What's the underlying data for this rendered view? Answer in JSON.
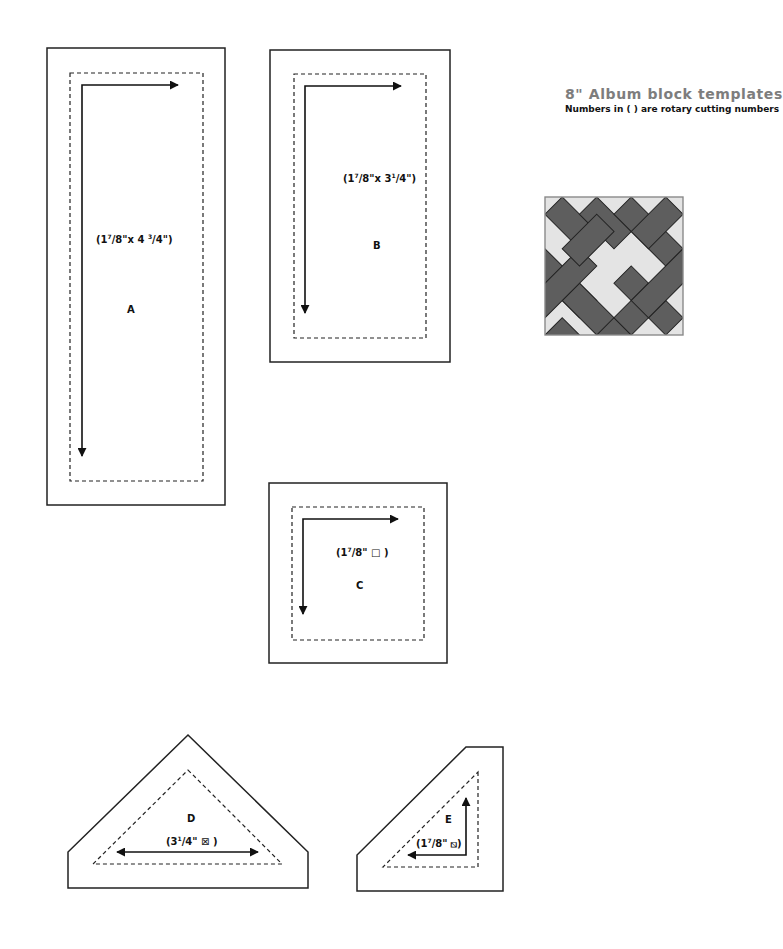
{
  "header": {
    "title": "8\" Album block templates",
    "subtitle": "Numbers in ( ) are rotary cutting numbers"
  },
  "colors": {
    "outline": "#222222",
    "dark_patch": "#5e5e5e",
    "light_patch": "#e4e4e4",
    "title_gray": "#7d7d7d"
  },
  "templates": [
    {
      "id": "A",
      "letter": "A",
      "whole": "1",
      "num": "7",
      "den": "8",
      "suffix": "\"x 4 ",
      "whole2_num": "3",
      "whole2_den": "4",
      "end": "\")",
      "cut_label": "(1 7/8\"x 4 3/4\")",
      "shape": "rectangle"
    },
    {
      "id": "B",
      "letter": "B",
      "cut_label": "(1 7/8\"x 3 1/4\")",
      "shape": "rectangle"
    },
    {
      "id": "C",
      "letter": "C",
      "cut_label": "(1 7/8\" □ )",
      "shape": "square"
    },
    {
      "id": "D",
      "letter": "D",
      "cut_label": "(3 1/4\" ⊠ )",
      "shape": "quarter-square triangle"
    },
    {
      "id": "E",
      "letter": "E",
      "cut_label": "(1 7/8\" ⧅ )",
      "shape": "half-square triangle"
    }
  ],
  "labels": {
    "A": {
      "open": "(1",
      "sup1": "7",
      "frac1": "/8\"x 4 ",
      "sup2": "3",
      "frac2": "/4\")"
    },
    "B": {
      "open": "(1",
      "sup1": "7",
      "frac1": "/8\"x 3",
      "sup2": "1",
      "frac2": "/4\")"
    },
    "C": {
      "open": "(1",
      "sup1": "7",
      "frac1": "/8\" ",
      "glyph": "□",
      "close": " )"
    },
    "D": {
      "open": "(3",
      "sup1": "1",
      "frac1": "/4\" ",
      "glyph": "⊠",
      "close": " )"
    },
    "E": {
      "open": "(1",
      "sup1": "7",
      "frac1": "/8\" ",
      "glyph": "⧅",
      "close": ")"
    }
  },
  "block_preview": {
    "name": "Album block",
    "size": "8\""
  }
}
